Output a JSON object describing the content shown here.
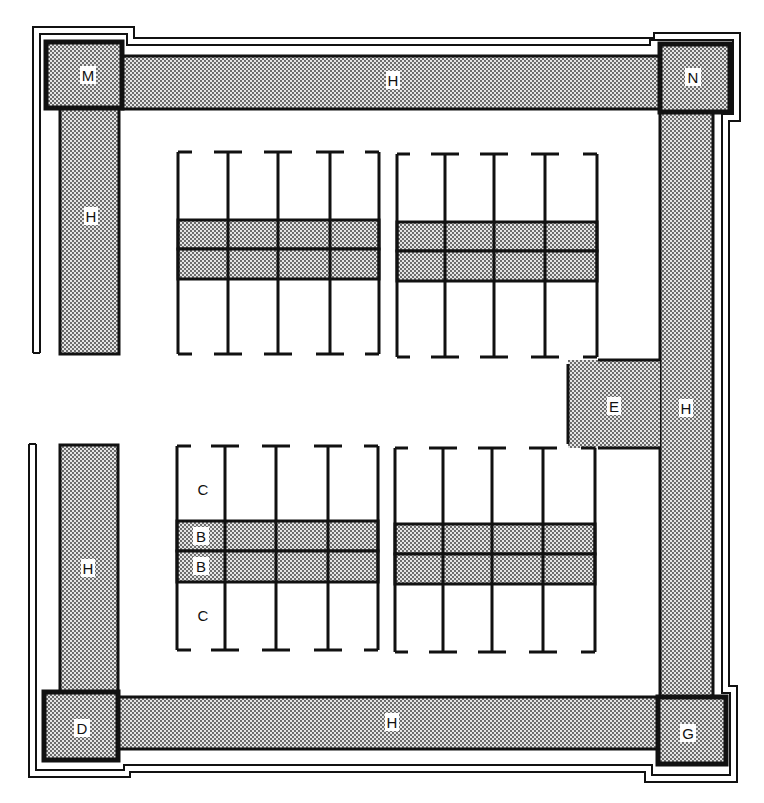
{
  "diagram": {
    "type": "floor-plan",
    "colors": {
      "ink": "#111111",
      "shade_dot": "#333333",
      "shade_bg": "#e6e6e6",
      "paper": "#ffffff"
    },
    "corners": [
      {
        "id": "M",
        "label": "M",
        "x": 46,
        "y": 42,
        "w": 76,
        "h": 66
      },
      {
        "id": "N",
        "label": "N",
        "x": 660,
        "y": 44,
        "w": 70,
        "h": 68
      },
      {
        "id": "D",
        "label": "D",
        "x": 44,
        "y": 692,
        "w": 74,
        "h": 68
      },
      {
        "id": "G",
        "label": "G",
        "x": 658,
        "y": 697,
        "w": 68,
        "h": 67
      }
    ],
    "bands": [
      {
        "id": "H-top",
        "label": "H",
        "x": 122,
        "y": 55,
        "w": 538,
        "h": 54,
        "lx": 392,
        "ly": 80
      },
      {
        "id": "H-left-upper",
        "label": "H",
        "x": 60,
        "y": 108,
        "w": 59,
        "h": 246,
        "lx": 90,
        "ly": 216
      },
      {
        "id": "H-left-lower",
        "label": "H",
        "x": 60,
        "y": 445,
        "w": 58,
        "h": 247,
        "lx": 88,
        "ly": 568
      },
      {
        "id": "H-right",
        "label": "H",
        "x": 660,
        "y": 112,
        "w": 53,
        "h": 585,
        "lx": 686,
        "ly": 408
      },
      {
        "id": "H-bottom",
        "label": "H",
        "x": 118,
        "y": 697,
        "w": 540,
        "h": 52,
        "lx": 392,
        "ly": 722
      }
    ],
    "entrance": {
      "id": "E",
      "label": "E",
      "x": 568,
      "y": 360,
      "w": 92,
      "h": 88,
      "lx": 614,
      "ly": 406
    },
    "stall_blocks": [
      {
        "id": "upper-left",
        "x0": 178,
        "x1": 379,
        "top": 152,
        "bottom": 354,
        "aisle_y0": 220,
        "aisle_y1": 279,
        "dividers": [
          228,
          278,
          330
        ]
      },
      {
        "id": "upper-right",
        "x0": 397,
        "x1": 597,
        "top": 154,
        "bottom": 357,
        "aisle_y0": 222,
        "aisle_y1": 281,
        "dividers": [
          445,
          494,
          545
        ]
      },
      {
        "id": "lower-left",
        "x0": 177,
        "x1": 378,
        "top": 446,
        "bottom": 650,
        "aisle_y0": 521,
        "aisle_y1": 582,
        "dividers": [
          225,
          276,
          328
        ]
      },
      {
        "id": "lower-right",
        "x0": 395,
        "x1": 595,
        "top": 448,
        "bottom": 652,
        "aisle_y0": 524,
        "aisle_y1": 584,
        "dividers": [
          443,
          492,
          543
        ]
      }
    ],
    "stall_labels": [
      {
        "label": "C",
        "x": 203,
        "y": 489
      },
      {
        "label": "B",
        "x": 201,
        "y": 536
      },
      {
        "label": "B",
        "x": 201,
        "y": 566
      },
      {
        "label": "C",
        "x": 203,
        "y": 615
      }
    ],
    "labels": {
      "M": "M",
      "N": "N",
      "D": "D",
      "G": "G",
      "E": "E",
      "H": "H",
      "B": "B",
      "C": "C"
    }
  }
}
